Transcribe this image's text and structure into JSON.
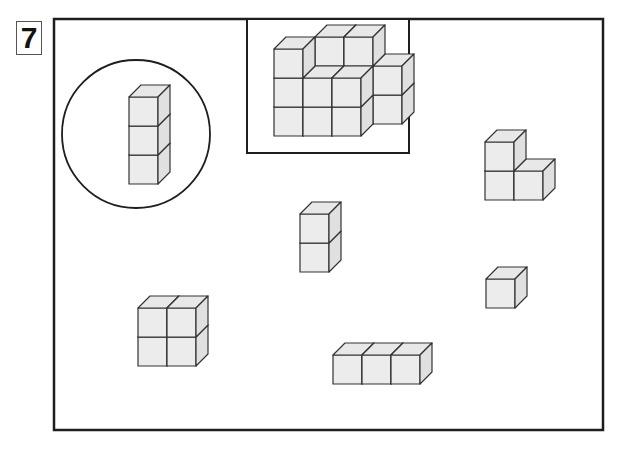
{
  "puzzle_number": "7",
  "colors": {
    "frame": "#1e1e1e",
    "cube_front": "#ececec",
    "cube_top": "#e8e8e8",
    "cube_side": "#e0e0e0",
    "cube_stroke": "#333333"
  },
  "frame": {
    "x": 54,
    "y": 19,
    "w": 549,
    "h": 411
  },
  "reference_circle": {
    "cx": 136,
    "cy": 134,
    "r": 74
  },
  "target_inset": {
    "x": 247,
    "y": 19,
    "w": 162,
    "h": 134
  },
  "cube": {
    "size": 29,
    "dx": 12,
    "dy": 12
  },
  "shapes": [
    {
      "name": "reference-tower-3-cubes",
      "origin": [
        129,
        184
      ],
      "cubes": [
        [
          0,
          0,
          0
        ],
        [
          0,
          1,
          0
        ],
        [
          0,
          2,
          0
        ]
      ]
    },
    {
      "name": "target-staircase-shape",
      "origin": [
        274,
        136
      ],
      "cubes": [
        [
          1,
          0,
          1
        ],
        [
          1,
          1,
          1
        ],
        [
          1,
          2,
          1
        ],
        [
          2,
          0,
          1
        ],
        [
          2,
          1,
          1
        ],
        [
          2,
          2,
          1
        ],
        [
          3,
          0,
          1
        ],
        [
          3,
          1,
          1
        ],
        [
          0,
          0,
          0
        ],
        [
          0,
          1,
          0
        ],
        [
          0,
          2,
          0
        ],
        [
          1,
          0,
          0
        ],
        [
          1,
          1,
          0
        ],
        [
          2,
          0,
          0
        ],
        [
          2,
          1,
          0
        ]
      ]
    },
    {
      "name": "piece-l-shape",
      "origin": [
        485,
        200
      ],
      "cubes": [
        [
          0,
          0,
          0
        ],
        [
          0,
          1,
          0
        ],
        [
          1,
          0,
          0
        ]
      ]
    },
    {
      "name": "piece-tower-2-cubes",
      "origin": [
        300,
        272
      ],
      "cubes": [
        [
          0,
          0,
          0
        ],
        [
          0,
          1,
          0
        ]
      ]
    },
    {
      "name": "piece-single-cube",
      "origin": [
        486,
        308
      ],
      "cubes": [
        [
          0,
          0,
          0
        ]
      ]
    },
    {
      "name": "piece-square-2x2",
      "origin": [
        138,
        366
      ],
      "cubes": [
        [
          0,
          0,
          0
        ],
        [
          0,
          1,
          0
        ],
        [
          1,
          0,
          0
        ],
        [
          1,
          1,
          0
        ]
      ]
    },
    {
      "name": "piece-row-3-cubes",
      "origin": [
        333,
        384
      ],
      "cubes": [
        [
          0,
          0,
          0
        ],
        [
          1,
          0,
          0
        ],
        [
          2,
          0,
          0
        ]
      ]
    }
  ]
}
